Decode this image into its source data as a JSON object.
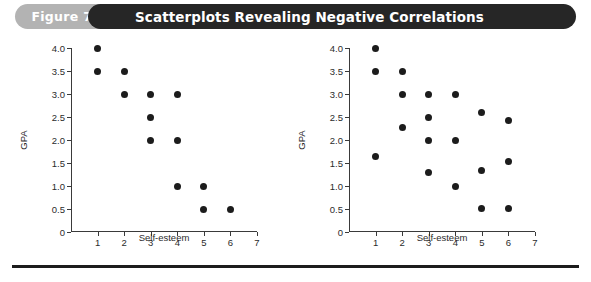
{
  "header": {
    "figure_number": "Figure 7-6",
    "title": "Scatterplots Revealing Negative Correlations",
    "pill_color": "#b3b3b3",
    "bar_color": "#262626",
    "title_color": "#ffffff"
  },
  "chart_data": [
    {
      "type": "scatter",
      "title": "",
      "xlabel": "Self-esteem",
      "ylabel": "GPA",
      "xlim": [
        0,
        7
      ],
      "ylim": [
        0,
        4.0
      ],
      "xticks": [
        1,
        2,
        3,
        4,
        5,
        6,
        7
      ],
      "xticklabels": [
        "1",
        "2",
        "3",
        "4",
        "5",
        "6",
        "7"
      ],
      "yticks": [
        0,
        0.5,
        1.0,
        1.5,
        2.0,
        2.5,
        3.0,
        3.5,
        4.0
      ],
      "yticklabels": [
        "0",
        "0.5",
        "1.0",
        "1.5",
        "2.0",
        "2.5",
        "3.0",
        "3.5",
        "4.0"
      ],
      "grid": false,
      "legend": false,
      "marker_color": "#1c1c1c",
      "points": [
        {
          "x": 1,
          "y": 4.0
        },
        {
          "x": 1,
          "y": 3.5
        },
        {
          "x": 2,
          "y": 3.5
        },
        {
          "x": 2,
          "y": 3.0
        },
        {
          "x": 3,
          "y": 3.0
        },
        {
          "x": 3,
          "y": 2.5
        },
        {
          "x": 3,
          "y": 2.0
        },
        {
          "x": 4,
          "y": 3.0
        },
        {
          "x": 4,
          "y": 2.0
        },
        {
          "x": 4,
          "y": 1.0
        },
        {
          "x": 5,
          "y": 1.0
        },
        {
          "x": 5,
          "y": 0.5
        },
        {
          "x": 6,
          "y": 0.5
        }
      ]
    },
    {
      "type": "scatter",
      "title": "",
      "xlabel": "Self-esteem",
      "ylabel": "GPA",
      "xlim": [
        0,
        7
      ],
      "ylim": [
        0,
        4.0
      ],
      "xticks": [
        1,
        2,
        3,
        4,
        5,
        6,
        7
      ],
      "xticklabels": [
        "1",
        "2",
        "3",
        "4",
        "5",
        "6",
        "7"
      ],
      "yticks": [
        0,
        0.5,
        1.0,
        1.5,
        2.0,
        2.5,
        3.0,
        3.5,
        4.0
      ],
      "yticklabels": [
        "0",
        "0.5",
        "1.0",
        "1.5",
        "2.0",
        "2.5",
        "3.0",
        "3.5",
        "4.0"
      ],
      "grid": false,
      "legend": false,
      "marker_color": "#1c1c1c",
      "points": [
        {
          "x": 1,
          "y": 4.0
        },
        {
          "x": 1,
          "y": 3.5
        },
        {
          "x": 1,
          "y": 1.65
        },
        {
          "x": 2,
          "y": 3.5
        },
        {
          "x": 2,
          "y": 3.0
        },
        {
          "x": 2,
          "y": 2.27
        },
        {
          "x": 3,
          "y": 3.0
        },
        {
          "x": 3,
          "y": 2.5
        },
        {
          "x": 3,
          "y": 2.0
        },
        {
          "x": 3,
          "y": 1.3
        },
        {
          "x": 4,
          "y": 3.0
        },
        {
          "x": 4,
          "y": 2.0
        },
        {
          "x": 4,
          "y": 1.0
        },
        {
          "x": 5,
          "y": 2.6
        },
        {
          "x": 5,
          "y": 1.33
        },
        {
          "x": 5,
          "y": 0.52
        },
        {
          "x": 6,
          "y": 2.42
        },
        {
          "x": 6,
          "y": 1.53
        },
        {
          "x": 6,
          "y": 0.52
        }
      ]
    }
  ]
}
